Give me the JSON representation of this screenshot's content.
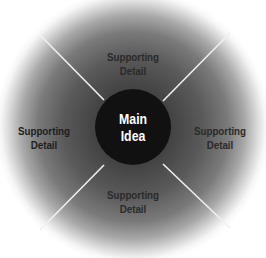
{
  "diagram": {
    "type": "concept-map",
    "center": {
      "line1": "Main",
      "line2": "Idea"
    },
    "nodes": [
      {
        "position": "top",
        "line1": "Supporting",
        "line2": "Detail"
      },
      {
        "position": "left",
        "line1": "Supporting",
        "line2": "Detail"
      },
      {
        "position": "right",
        "line1": "Supporting",
        "line2": "Detail"
      },
      {
        "position": "bottom",
        "line1": "Supporting",
        "line2": "Detail"
      }
    ],
    "colors": {
      "center_fill": "#111111",
      "center_text": "#ffffff",
      "divider": "#f0f0f0",
      "ring_inner": "#3a3a3a",
      "ring_outer": "#ffffff"
    }
  }
}
